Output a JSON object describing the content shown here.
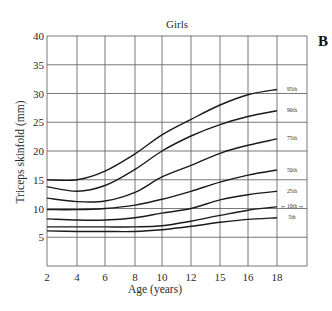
{
  "chart_data": {
    "type": "line",
    "title": "Girls",
    "panel_label": "B",
    "xlabel": "Age (years)",
    "ylabel": "Triceps skinfold (mm)",
    "ylim": [
      0,
      40
    ],
    "yticks": [
      5,
      10,
      15,
      20,
      25,
      30,
      35,
      40
    ],
    "xtick_labels": [
      "2",
      "4",
      "6",
      "8",
      "10",
      "12",
      "15",
      "16",
      "18"
    ],
    "grid": true,
    "legend_position": "right-inline",
    "x": [
      2,
      4,
      6,
      8,
      10,
      12,
      14,
      16,
      18
    ],
    "series": [
      {
        "name": "95th",
        "values": [
          15.0,
          15.0,
          16.5,
          19.5,
          22.8,
          25.5,
          28.0,
          29.8,
          30.7
        ]
      },
      {
        "name": "90th",
        "values": [
          13.8,
          13.0,
          14.0,
          16.8,
          20.0,
          22.6,
          24.6,
          26.0,
          27.0
        ]
      },
      {
        "name": "75th",
        "values": [
          11.8,
          11.2,
          11.3,
          12.8,
          15.5,
          17.5,
          19.6,
          21.0,
          22.1
        ]
      },
      {
        "name": "50th",
        "values": [
          9.8,
          9.8,
          10.0,
          10.6,
          11.6,
          13.0,
          14.6,
          15.8,
          16.7
        ]
      },
      {
        "name": "25th",
        "values": [
          8.2,
          8.0,
          8.0,
          8.4,
          9.2,
          10.0,
          11.5,
          12.4,
          13.0
        ]
      },
      {
        "name": "10th",
        "values": [
          6.8,
          6.8,
          6.8,
          6.8,
          7.0,
          7.8,
          8.8,
          9.7,
          10.3
        ]
      },
      {
        "name": "5th",
        "values": [
          6.1,
          6.0,
          6.0,
          6.0,
          6.3,
          6.9,
          7.6,
          8.1,
          8.4
        ]
      }
    ]
  }
}
